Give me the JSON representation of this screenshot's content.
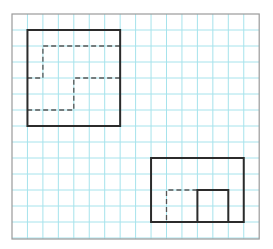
{
  "figure": {
    "type": "grid-diagram",
    "colors": {
      "background": "#ffffff",
      "grid": "#a6e3ec",
      "frame": "#9a9a9a",
      "shape": "#2b2b2b",
      "dashed": "#555555"
    },
    "grid": {
      "origin_x": 12,
      "origin_y": 14,
      "cell_w": 15.45,
      "cell_h": 16,
      "cols": 16,
      "rows": 14
    },
    "shapes": [
      {
        "name": "top-left-square",
        "rect": {
          "col": 1,
          "row": 1,
          "w": 6,
          "h": 6
        },
        "dashed_paths": [
          [
            [
              7,
              2
            ],
            [
              2,
              2
            ],
            [
              2,
              4
            ],
            [
              1,
              4
            ]
          ],
          [
            [
              7,
              4
            ],
            [
              4,
              4
            ],
            [
              4,
              6
            ],
            [
              1,
              6
            ]
          ]
        ],
        "solid_inner": []
      },
      {
        "name": "bottom-right-rectangle",
        "rect": {
          "col": 9,
          "row": 9,
          "w": 6,
          "h": 4
        },
        "dashed_paths": [
          [
            [
              12,
              11
            ],
            [
              10,
              11
            ],
            [
              10,
              13
            ]
          ]
        ],
        "solid_inner": [
          {
            "col": 12,
            "row": 11,
            "w": 2,
            "h": 2
          }
        ]
      }
    ]
  }
}
